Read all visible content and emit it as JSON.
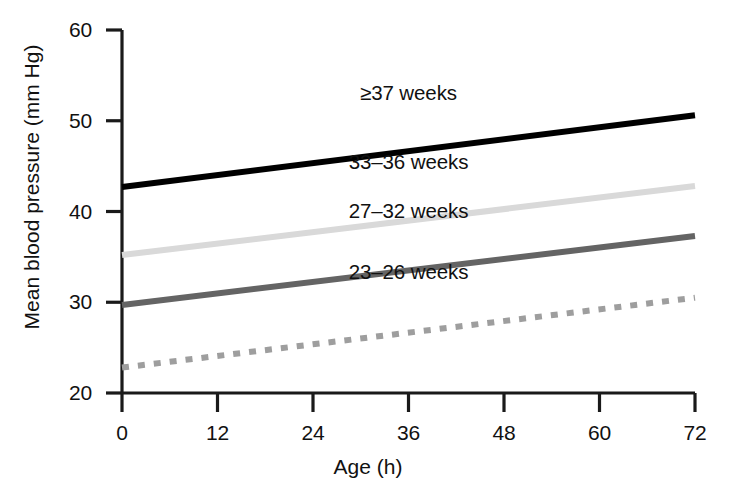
{
  "chart_data": {
    "type": "line",
    "title": "",
    "xlabel": "Age (h)",
    "ylabel": "Mean blood pressure (mm Hg)",
    "xlim": [
      0,
      72
    ],
    "ylim": [
      20,
      60
    ],
    "xticks": [
      0,
      12,
      24,
      36,
      48,
      60,
      72
    ],
    "xtick_labels": [
      "0",
      "12",
      "24",
      "36",
      "48",
      "60",
      "72"
    ],
    "yticks": [
      20,
      30,
      40,
      50,
      60
    ],
    "ytick_labels": [
      "20",
      "30",
      "40",
      "50",
      "60"
    ],
    "grid": false,
    "legend_position": "inline-annotations",
    "x": [
      0,
      72
    ],
    "series": [
      {
        "name": "≥37 weeks",
        "label": "≥37 weeks",
        "values": [
          42.7,
          50.6
        ],
        "color": "#000000",
        "style": "solid",
        "width": 6,
        "label_x": 36,
        "label_y": 53.0
      },
      {
        "name": "33–36 weeks",
        "label": "33–36 weeks",
        "values": [
          35.2,
          42.8
        ],
        "color": "#d9d9d9",
        "style": "solid",
        "width": 6,
        "label_x": 36,
        "label_y": 45.3
      },
      {
        "name": "27–32 weeks",
        "label": "27–32 weeks",
        "values": [
          29.7,
          37.3
        ],
        "color": "#646464",
        "style": "solid",
        "width": 6,
        "label_x": 36,
        "label_y": 39.9
      },
      {
        "name": "23–26 weeks",
        "label": "23–26 weeks",
        "values": [
          22.8,
          30.5
        ],
        "color": "#9e9e9e",
        "style": "dotted",
        "width": 6,
        "label_x": 36,
        "label_y": 33.2
      }
    ]
  },
  "axis": {
    "xlabel": "Age (h)",
    "ylabel": "Mean blood pressure (mm Hg)",
    "xtick_labels": [
      "0",
      "12",
      "24",
      "36",
      "48",
      "60",
      "72"
    ],
    "ytick_labels": [
      "20",
      "30",
      "40",
      "50",
      "60"
    ]
  },
  "labels": {
    "s0": "≥37 weeks",
    "s1": "33–36 weeks",
    "s2": "27–32 weeks",
    "s3": "23–26 weeks"
  },
  "colors": {
    "axis": "#1a1a1a",
    "term": "#000000",
    "late_preterm": "#d9d9d9",
    "very_preterm": "#646464",
    "extremely_preterm": "#9e9e9e",
    "background": "#ffffff"
  }
}
